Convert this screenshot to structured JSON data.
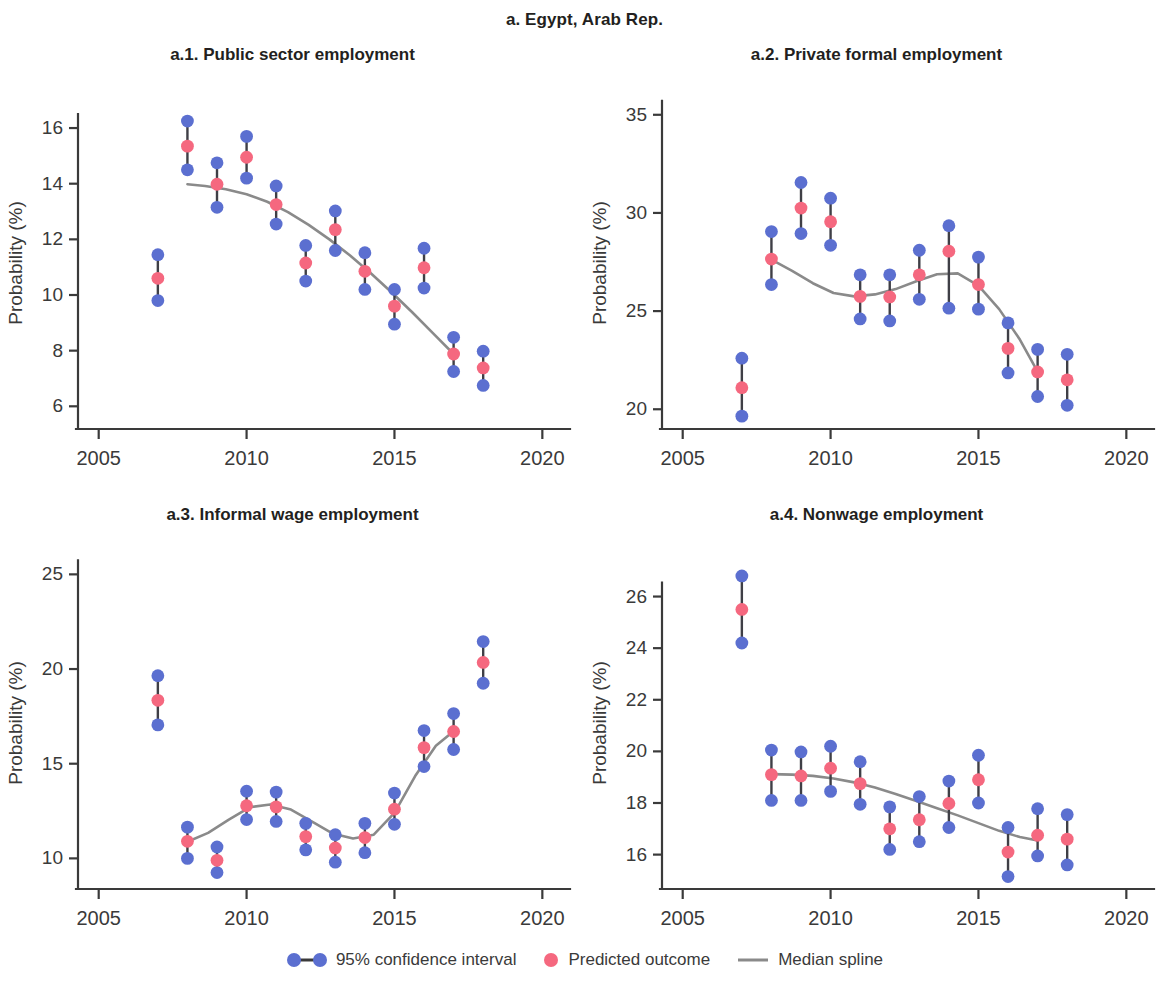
{
  "figure": {
    "title": "a. Egypt, Arab Rep.",
    "ylabel": "Probability (%)",
    "colors": {
      "ci": "#5b6fd0",
      "predicted": "#f5687f",
      "spline": "#8a8a8a",
      "axis": "#3a3a3a",
      "text": "#231f20"
    }
  },
  "legend": {
    "ci_label": "95% confidence interval",
    "predicted_label": "Predicted outcome",
    "spline_label": "Median spline"
  },
  "chart_data": [
    {
      "id": "a1",
      "type": "scatter",
      "title": "a.1. Public sector employment",
      "xlabel": "",
      "ylabel": "Probability (%)",
      "xlim": [
        2004.3,
        2020.8
      ],
      "ylim": [
        5.4,
        16.9
      ],
      "xticks": [
        2005,
        2010,
        2015,
        2020
      ],
      "yticks": [
        6,
        8,
        10,
        12,
        14,
        16
      ],
      "grid": false,
      "x": [
        2007,
        2008,
        2009,
        2010,
        2011,
        2012,
        2013,
        2014,
        2015,
        2016,
        2017,
        2018
      ],
      "predicted": [
        10.6,
        15.35,
        13.98,
        14.95,
        13.25,
        11.15,
        12.35,
        10.85,
        9.6,
        10.98,
        7.88,
        7.38
      ],
      "ci_low": [
        9.8,
        14.5,
        13.15,
        14.2,
        12.55,
        10.5,
        11.6,
        10.2,
        8.95,
        10.25,
        7.25,
        6.75
      ],
      "ci_high": [
        11.45,
        16.25,
        14.75,
        15.7,
        13.92,
        11.78,
        13.02,
        11.52,
        10.2,
        11.68,
        8.48,
        7.98
      ],
      "spline_x": [
        2008.0,
        2008.6,
        2009.3,
        2010.0,
        2010.7,
        2011.4,
        2012.1,
        2012.8,
        2013.5,
        2014.2,
        2014.9,
        2015.6,
        2016.3,
        2017.0
      ],
      "spline_y": [
        13.98,
        13.92,
        13.8,
        13.62,
        13.35,
        12.98,
        12.52,
        12.0,
        11.42,
        10.78,
        10.1,
        9.38,
        8.63,
        7.88
      ]
    },
    {
      "id": "a2",
      "type": "scatter",
      "title": "a.2. Private formal employment",
      "xlabel": "",
      "ylabel": "Probability (%)",
      "xlim": [
        2004.3,
        2020.8
      ],
      "ylim": [
        19.3,
        35.6
      ],
      "xticks": [
        2005,
        2010,
        2015,
        2020
      ],
      "yticks": [
        20,
        25,
        30,
        35
      ],
      "grid": false,
      "x": [
        2007,
        2008,
        2009,
        2010,
        2011,
        2012,
        2013,
        2014,
        2015,
        2016,
        2017,
        2018
      ],
      "predicted": [
        21.1,
        27.65,
        30.25,
        29.55,
        25.75,
        25.72,
        26.85,
        28.05,
        26.35,
        23.1,
        21.9,
        21.5
      ],
      "ci_low": [
        19.65,
        26.35,
        28.95,
        28.35,
        24.6,
        24.5,
        25.6,
        25.15,
        25.1,
        21.85,
        20.65,
        20.2
      ],
      "ci_high": [
        22.6,
        29.05,
        31.55,
        30.75,
        26.85,
        26.85,
        28.1,
        29.35,
        27.75,
        24.4,
        23.05,
        22.8
      ],
      "spline_x": [
        2008.0,
        2008.7,
        2009.4,
        2010.1,
        2010.8,
        2011.5,
        2012.2,
        2012.9,
        2013.6,
        2014.3,
        2015.0,
        2015.7,
        2016.4,
        2017.0
      ],
      "spline_y": [
        27.62,
        27.05,
        26.42,
        25.92,
        25.75,
        25.85,
        26.12,
        26.52,
        26.88,
        26.92,
        26.3,
        25.1,
        23.55,
        21.92
      ]
    },
    {
      "id": "a3",
      "type": "scatter",
      "title": "a.3. Informal wage employment",
      "xlabel": "",
      "ylabel": "Probability (%)",
      "xlim": [
        2004.3,
        2020.8
      ],
      "ylim": [
        8.7,
        25.6
      ],
      "xticks": [
        2005,
        2010,
        2015,
        2020
      ],
      "yticks": [
        10,
        15,
        20,
        25
      ],
      "grid": false,
      "x": [
        2007,
        2008,
        2009,
        2010,
        2011,
        2012,
        2013,
        2014,
        2015,
        2016,
        2017,
        2018
      ],
      "predicted": [
        18.35,
        10.9,
        9.9,
        12.78,
        12.72,
        11.15,
        10.55,
        11.1,
        12.6,
        15.85,
        16.7,
        20.35
      ],
      "ci_low": [
        17.05,
        10.0,
        9.25,
        12.05,
        11.95,
        10.45,
        9.8,
        10.3,
        11.8,
        14.85,
        15.75,
        19.25
      ],
      "ci_high": [
        19.65,
        11.65,
        10.6,
        13.55,
        13.5,
        11.85,
        11.25,
        11.85,
        13.45,
        16.75,
        17.65,
        21.45
      ],
      "spline_x": [
        2008.0,
        2008.7,
        2009.4,
        2010.1,
        2010.8,
        2011.5,
        2012.2,
        2012.9,
        2013.6,
        2014.3,
        2015.0,
        2015.7,
        2016.4,
        2017.0
      ],
      "spline_y": [
        10.88,
        11.35,
        12.05,
        12.7,
        12.85,
        12.58,
        11.95,
        11.32,
        11.05,
        11.25,
        12.4,
        14.35,
        15.95,
        16.72
      ]
    },
    {
      "id": "a4",
      "type": "scatter",
      "title": "a.4. Nonwage employment",
      "xlabel": "",
      "ylabel": "Probability (%)",
      "xlim": [
        2004.3,
        2020.8
      ],
      "ylim": [
        14.9,
        27.3
      ],
      "xticks": [
        2005,
        2010,
        2015,
        2020
      ],
      "yticks": [
        16,
        18,
        20,
        22,
        24,
        26
      ],
      "grid": false,
      "x": [
        2007,
        2008,
        2009,
        2010,
        2011,
        2012,
        2013,
        2014,
        2015,
        2016,
        2017,
        2018
      ],
      "predicted": [
        25.5,
        19.1,
        19.05,
        19.35,
        18.75,
        17.0,
        17.35,
        17.98,
        18.9,
        16.1,
        16.75,
        16.6
      ],
      "ci_low": [
        24.2,
        18.1,
        18.1,
        18.45,
        17.95,
        16.2,
        16.5,
        17.05,
        18.0,
        15.15,
        15.95,
        15.6
      ],
      "ci_high": [
        26.8,
        20.05,
        19.98,
        20.2,
        19.6,
        17.85,
        18.25,
        18.85,
        19.85,
        17.05,
        17.78,
        17.55
      ],
      "spline_x": [
        2008.0,
        2008.7,
        2009.4,
        2010.1,
        2010.8,
        2011.5,
        2012.2,
        2012.9,
        2013.6,
        2014.3,
        2015.0,
        2015.7,
        2016.4,
        2017.0
      ],
      "spline_y": [
        19.12,
        19.1,
        19.05,
        18.95,
        18.8,
        18.6,
        18.35,
        18.08,
        17.8,
        17.52,
        17.22,
        16.92,
        16.68,
        16.55
      ]
    }
  ]
}
